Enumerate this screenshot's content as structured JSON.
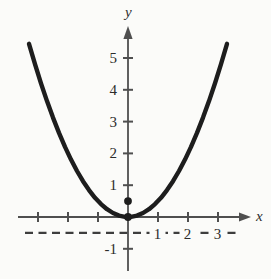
{
  "figure": {
    "bg_color": "#fbfbf9",
    "axis_color": "#4f4f4f",
    "dash_color": "#3d3d3d",
    "curve_color": "#1d1d1d",
    "text_color": "#2b2b2b"
  },
  "chart_data": {
    "type": "line",
    "title": "",
    "xlabel": "x",
    "ylabel": "y",
    "xlim": [
      -3.7,
      4.1
    ],
    "ylim": [
      -1.7,
      6.0
    ],
    "grid": false,
    "legend": false,
    "x_ticks": [
      -3,
      -2,
      -1,
      1,
      2,
      3
    ],
    "y_ticks": [
      -1,
      1,
      2,
      3,
      4,
      5
    ],
    "x_tick_labels": [
      {
        "value": 1,
        "label": "1"
      },
      {
        "value": 2,
        "label": "2"
      },
      {
        "value": 3,
        "label": "3"
      }
    ],
    "y_tick_labels": [
      {
        "value": 5,
        "label": "5"
      },
      {
        "value": 4,
        "label": "4"
      },
      {
        "value": 3,
        "label": "3"
      },
      {
        "value": 2,
        "label": "2"
      },
      {
        "value": 1,
        "label": "1"
      },
      {
        "value": -1,
        "label": "-1"
      }
    ],
    "series": [
      {
        "name": "parabola-curve",
        "x": [
          -3.3,
          -3.1,
          -2.9,
          -2.7,
          -2.5,
          -2.3,
          -2.1,
          -1.9,
          -1.7,
          -1.5,
          -1.3,
          -1.1,
          -0.9,
          -0.7,
          -0.5,
          -0.3,
          -0.1,
          0,
          0.1,
          0.3,
          0.5,
          0.7,
          0.9,
          1.1,
          1.3,
          1.5,
          1.7,
          1.9,
          2.1,
          2.3,
          2.5,
          2.7,
          2.9,
          3.1,
          3.3
        ],
        "y": [
          5.445,
          4.805,
          4.205,
          3.645,
          3.125,
          2.645,
          2.205,
          1.805,
          1.445,
          1.125,
          0.845,
          0.605,
          0.405,
          0.245,
          0.125,
          0.045,
          0.005,
          0,
          0.005,
          0.045,
          0.125,
          0.245,
          0.405,
          0.605,
          0.845,
          1.125,
          1.445,
          1.805,
          2.205,
          2.645,
          3.125,
          3.645,
          4.205,
          4.805,
          5.445
        ]
      }
    ],
    "marked_points": [
      {
        "x": 0,
        "y": 0.5
      },
      {
        "x": 0,
        "y": 0
      }
    ],
    "dashed_line_y": -0.5
  }
}
